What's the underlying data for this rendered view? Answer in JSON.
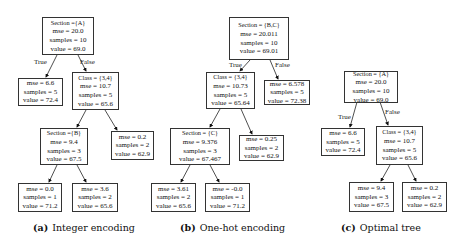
{
  "figure": {
    "subfigures": [
      {
        "id": "a",
        "caption_letter": "(a)",
        "caption_text": "Integer encoding",
        "edge_labels": {
          "true": "True",
          "false": "False"
        },
        "nodes": {
          "root": {
            "cond": "Section ={A}",
            "mse": "mse = 20.0",
            "samples": "samples = 10",
            "value": "value = 69.0"
          },
          "l": {
            "mse": "mse = 6.6",
            "samples": "samples = 5",
            "value": "value = 72.4"
          },
          "r": {
            "cond": "Class = {3,4}",
            "mse": "mse = 10.7",
            "samples": "samples = 5",
            "value": "value = 65.6"
          },
          "rl": {
            "cond": "Section ={B}",
            "mse": "mse = 9.4",
            "samples": "samples = 3",
            "value": "value = 67.5"
          },
          "rr": {
            "mse": "mse = 0.2",
            "samples": "samples = 2",
            "value": "value = 62.9"
          },
          "rll": {
            "mse": "mse = 0.0",
            "samples": "samples = 1",
            "value": "value = 71.2"
          },
          "rlr": {
            "mse": "mse = 3.6",
            "samples": "samples = 2",
            "value": "value = 65.6"
          }
        }
      },
      {
        "id": "b",
        "caption_letter": "(b)",
        "caption_text": "One-hot encoding",
        "edge_labels": {
          "true": "True",
          "false": "False"
        },
        "nodes": {
          "root": {
            "cond": "Section = {B,C}",
            "mse": "mse = 20.011",
            "samples": "samples = 10",
            "value": "value = 69.01"
          },
          "l": {
            "cond": "Class = {3,4}",
            "mse": "mse = 10.73",
            "samples": "samples = 5",
            "value": "value = 65.64"
          },
          "r": {
            "mse": "mse = 6.578",
            "samples": "samples = 5",
            "value": "value = 72.38"
          },
          "ll": {
            "cond": "Section = {C}",
            "mse": "mse = 9.376",
            "samples": "samples = 3",
            "value": "value = 67.467"
          },
          "lr": {
            "mse": "mse = 0.25",
            "samples": "samples = 2",
            "value": "value = 62.9"
          },
          "lll": {
            "mse": "mse = 3.61",
            "samples": "samples = 2",
            "value": "value = 65.6"
          },
          "llr": {
            "mse": "mse = -0.0",
            "samples": "samples = 1",
            "value": "value = 71.2"
          }
        }
      },
      {
        "id": "c",
        "caption_letter": "(c)",
        "caption_text": "Optimal tree",
        "edge_labels": {
          "true": "True",
          "false": "False"
        },
        "nodes": {
          "root": {
            "cond": "Section = {A}",
            "mse": "mse = 20.0",
            "samples": "samples = 10",
            "value": "value = 69.0"
          },
          "l": {
            "mse": "mse = 6.6",
            "samples": "samples = 5",
            "value": "value = 72.4"
          },
          "r": {
            "cond": "Class = {3,4}",
            "mse": "mse = 10.7",
            "samples": "samples = 5",
            "value": "value = 65.6"
          },
          "rl": {
            "mse": "mse = 9.4",
            "samples": "samples = 3",
            "value": "value = 67.5"
          },
          "rr": {
            "mse": "mse = 0.2",
            "samples": "samples = 2",
            "value": "value = 62.9"
          }
        }
      }
    ]
  }
}
